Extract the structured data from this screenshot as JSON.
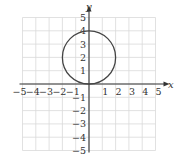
{
  "chart_data": {
    "type": "line",
    "title": "",
    "xlabel": "x",
    "ylabel": "y",
    "xlim": [
      -5,
      5
    ],
    "ylim": [
      -5,
      5
    ],
    "grid": true,
    "x_ticks": [
      "-5",
      "-4",
      "-3",
      "-2",
      "-1",
      "1",
      "2",
      "3",
      "4",
      "5"
    ],
    "y_ticks": [
      "5",
      "4",
      "3",
      "2",
      "1",
      "-1",
      "-2",
      "-3",
      "-4",
      "-5"
    ],
    "series": [
      {
        "name": "circle",
        "shape": "circle",
        "center": [
          0,
          2
        ],
        "radius": 2,
        "equation": "x^2 + (y-2)^2 = 4"
      }
    ]
  },
  "colors": {
    "grid": "#d9d9d9",
    "axis": "#333333",
    "curve": "#444444"
  }
}
